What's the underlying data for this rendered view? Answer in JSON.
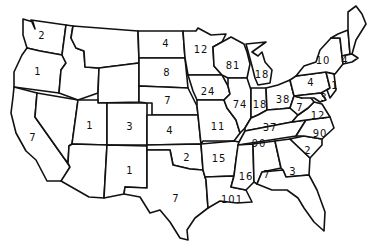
{
  "map": {
    "type": "US state choropleth-style count map",
    "labels": [
      {
        "state": "WA",
        "value": "2",
        "x": 42,
        "y": 36
      },
      {
        "state": "OR",
        "value": "1",
        "x": 38,
        "y": 72
      },
      {
        "state": "CA",
        "value": "7",
        "x": 33,
        "y": 138
      },
      {
        "state": "UT",
        "value": "1",
        "x": 90,
        "y": 126
      },
      {
        "state": "CO",
        "value": "3",
        "x": 130,
        "y": 127
      },
      {
        "state": "NM",
        "value": "1",
        "x": 130,
        "y": 171
      },
      {
        "state": "ND",
        "value": "4",
        "x": 166,
        "y": 44
      },
      {
        "state": "SD",
        "value": "8",
        "x": 167,
        "y": 73
      },
      {
        "state": "NE",
        "value": "7",
        "x": 168,
        "y": 101
      },
      {
        "state": "KS",
        "value": "4",
        "x": 170,
        "y": 131
      },
      {
        "state": "OK",
        "value": "2",
        "x": 187,
        "y": 158
      },
      {
        "state": "TX",
        "value": "7",
        "x": 176,
        "y": 199
      },
      {
        "state": "MN",
        "value": "12",
        "x": 201,
        "y": 50
      },
      {
        "state": "IA",
        "value": "24",
        "x": 208,
        "y": 92
      },
      {
        "state": "MO",
        "value": "11",
        "x": 218,
        "y": 127
      },
      {
        "state": "AR",
        "value": "15",
        "x": 219,
        "y": 159
      },
      {
        "state": "LA",
        "value": "101",
        "x": 232,
        "y": 200
      },
      {
        "state": "WI",
        "value": "81",
        "x": 233,
        "y": 66
      },
      {
        "state": "IL",
        "value": "74",
        "x": 240,
        "y": 105
      },
      {
        "state": "MI",
        "value": "18",
        "x": 262,
        "y": 75
      },
      {
        "state": "IN",
        "value": "18",
        "x": 260,
        "y": 105
      },
      {
        "state": "OH",
        "value": "38",
        "x": 283,
        "y": 100
      },
      {
        "state": "KY",
        "value": "37",
        "x": 270,
        "y": 128
      },
      {
        "state": "TN",
        "value": "90",
        "x": 259,
        "y": 144
      },
      {
        "state": "MS",
        "value": "16",
        "x": 246,
        "y": 177
      },
      {
        "state": "AL",
        "value": "7",
        "x": 267,
        "y": 175
      },
      {
        "state": "GA",
        "value": "3",
        "x": 293,
        "y": 172
      },
      {
        "state": "SC",
        "value": "2",
        "x": 308,
        "y": 151
      },
      {
        "state": "NC",
        "value": "90",
        "x": 320,
        "y": 134
      },
      {
        "state": "VA",
        "value": "12",
        "x": 318,
        "y": 116
      },
      {
        "state": "WV",
        "value": "7",
        "x": 300,
        "y": 108
      },
      {
        "state": "PA",
        "value": "4",
        "x": 311,
        "y": 83
      },
      {
        "state": "NY",
        "value": "10",
        "x": 323,
        "y": 61
      },
      {
        "state": "MA",
        "value": "4",
        "x": 345,
        "y": 61
      },
      {
        "state": "NJ",
        "value": "1",
        "x": 335,
        "y": 86
      },
      {
        "state": "MD",
        "value": "3",
        "x": 324,
        "y": 98
      }
    ]
  }
}
